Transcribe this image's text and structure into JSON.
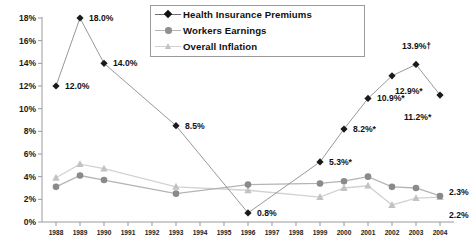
{
  "chart_data": {
    "type": "line",
    "title": "",
    "xlabel": "",
    "ylabel": "",
    "ylim": [
      0,
      18
    ],
    "ytick_labels": [
      "0%",
      "2%",
      "4%",
      "6%",
      "8%",
      "10%",
      "12%",
      "14%",
      "16%",
      "18%"
    ],
    "ytick_values": [
      0,
      2,
      4,
      6,
      8,
      10,
      12,
      14,
      16,
      18
    ],
    "grid": false,
    "legend_position": "top-center",
    "categories": [
      "1988",
      "1989",
      "1990",
      "1991",
      "1992",
      "1993",
      "1994",
      "1995",
      "1996",
      "1997",
      "1998",
      "1999",
      "2000",
      "2001",
      "2002",
      "2003",
      "2004"
    ],
    "series": [
      {
        "name": "Health Insurance Premiums",
        "marker": "diamond",
        "color": "#1a1a1a",
        "line_color": "#8c8c8c",
        "x": [
          "1988",
          "1989",
          "1990",
          "1993",
          "1996",
          "1999",
          "2000",
          "2001",
          "2002",
          "2003",
          "2004"
        ],
        "values": [
          12.0,
          18.0,
          14.0,
          8.5,
          0.8,
          5.3,
          8.2,
          10.9,
          12.9,
          13.9,
          11.2
        ],
        "labels": [
          "12.0%",
          "18.0%",
          "14.0%",
          "8.5%",
          "0.8%",
          "5.3%*",
          "8.2%*",
          "10.9%*",
          "12.9%*",
          "13.9%†",
          "11.2%*"
        ]
      },
      {
        "name": "Workers Earnings",
        "marker": "circle",
        "color": "#8a8a8a",
        "line_color": "#b4b4b4",
        "x": [
          "1988",
          "1989",
          "1990",
          "1993",
          "1996",
          "1999",
          "2000",
          "2001",
          "2002",
          "2003",
          "2004"
        ],
        "values": [
          3.1,
          4.1,
          3.7,
          2.5,
          3.3,
          3.4,
          3.6,
          4.0,
          3.1,
          3.0,
          2.3
        ],
        "labels": [
          "",
          "",
          "",
          "",
          "",
          "",
          "",
          "",
          "",
          "",
          "2.3%"
        ]
      },
      {
        "name": "Overall Inflation",
        "marker": "triangle",
        "color": "#c2c2c2",
        "line_color": "#d2d2d2",
        "x": [
          "1988",
          "1989",
          "1990",
          "1993",
          "1996",
          "1999",
          "2000",
          "2001",
          "2002",
          "2003",
          "2004"
        ],
        "values": [
          3.9,
          5.1,
          4.7,
          3.1,
          2.8,
          2.2,
          3.0,
          3.2,
          1.5,
          2.1,
          2.2
        ],
        "labels": [
          "",
          "",
          "",
          "",
          "",
          "",
          "",
          "",
          "",
          "",
          "2.2%"
        ]
      }
    ],
    "annotations": [
      {
        "text": "12.0%",
        "x": 1988,
        "y": 12.0,
        "dx": 9,
        "dy": 0
      },
      {
        "text": "18.0%",
        "x": 1989,
        "y": 18.0,
        "dx": 9,
        "dy": 0
      },
      {
        "text": "14.0%",
        "x": 1990,
        "y": 14.0,
        "dx": 9,
        "dy": 0
      },
      {
        "text": "8.5%",
        "x": 1993,
        "y": 8.5,
        "dx": 9,
        "dy": 0
      },
      {
        "text": "0.8%",
        "x": 1996,
        "y": 0.8,
        "dx": 9,
        "dy": 0
      },
      {
        "text": "5.3%*",
        "x": 1999,
        "y": 5.3,
        "dx": 9,
        "dy": 0
      },
      {
        "text": "8.2%*",
        "x": 2000,
        "y": 8.2,
        "dx": 9,
        "dy": 0
      },
      {
        "text": "10.9%*",
        "x": 2001,
        "y": 10.9,
        "dx": 9,
        "dy": 0
      },
      {
        "text": "12.9%*",
        "x": 2002,
        "y": 12.9,
        "dx": 3,
        "dy": 15
      },
      {
        "text": "13.9%†",
        "x": 2003,
        "y": 13.9,
        "dx": -14,
        "dy": -18
      },
      {
        "text": "11.2%*",
        "x": 2004,
        "y": 11.2,
        "dx": -36,
        "dy": 22
      },
      {
        "text": "2.3%",
        "x": 2004,
        "y": 2.3,
        "dx": 9,
        "dy": -4
      },
      {
        "text": "2.2%",
        "x": 2004,
        "y": 2.2,
        "dx": 9,
        "dy": 18
      }
    ]
  }
}
